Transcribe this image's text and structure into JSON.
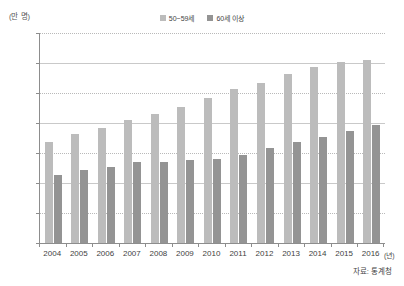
{
  "chart_data": {
    "type": "bar",
    "title": "",
    "subtitle": "",
    "unit_label": "(만 명)",
    "xlabel": "(년)",
    "ylabel": "",
    "ylim": [
      0,
      700
    ],
    "ytick_step": 100,
    "yticks": [
      700,
      600,
      500,
      400,
      300,
      200,
      100,
      0
    ],
    "grid": true,
    "legend_position": "top-center",
    "categories": [
      "2004",
      "2005",
      "2006",
      "2007",
      "2008",
      "2009",
      "2010",
      "2011",
      "2012",
      "2013",
      "2014",
      "2015",
      "2016"
    ],
    "series": [
      {
        "name": "50~59세",
        "color": "#bcbcbc",
        "values": [
          337,
          363,
          385,
          410,
          430,
          453,
          482,
          512,
          535,
          563,
          588,
          604,
          611
        ]
      },
      {
        "name": "60세 이상",
        "color": "#949494",
        "values": [
          227,
          242,
          254,
          270,
          270,
          278,
          279,
          294,
          318,
          337,
          353,
          373,
          395
        ]
      }
    ],
    "source_note": "자료: 통계청"
  },
  "colors": {
    "series1": "#bcbcbc",
    "series2": "#949494",
    "axis": "#8d8d8d",
    "grid": "#b9b9b9",
    "text": "#3f3f3f",
    "background": "#ffffff"
  }
}
